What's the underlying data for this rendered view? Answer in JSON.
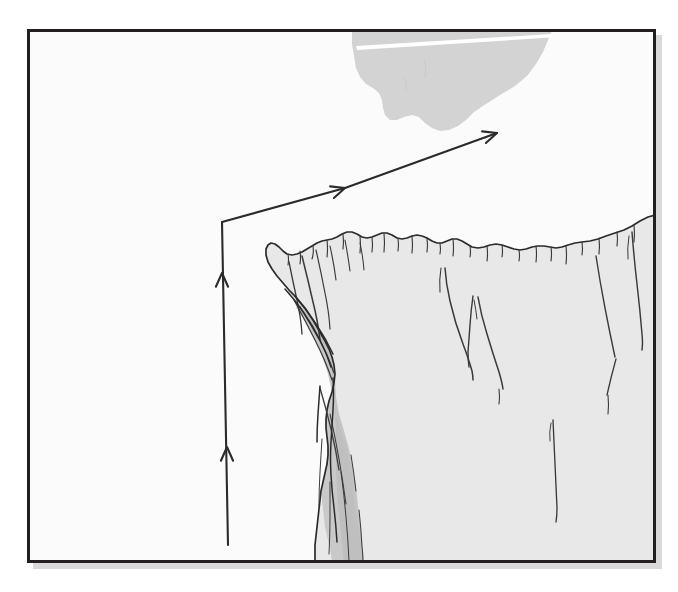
{
  "figure": {
    "title": "Cliff edge cross-section with ascent and traverse path",
    "kind": "hand-drawn line illustration",
    "background_color": "#ffffff",
    "frame": {
      "name": "illustration-border",
      "x": 27,
      "y": 29,
      "width": 629,
      "height": 534,
      "stroke_color": "#231f20",
      "stroke_width": 3,
      "fill_color": "#fbfbfb",
      "shadow_color": "#d9d9d9"
    },
    "palette": {
      "ink": "#2b2b2b",
      "ink_light": "#4a4a4a",
      "cliff_face": "#e8e8e8",
      "cliff_face_edge": "#e2e2e2",
      "gully_shadow": "#c9c9c9",
      "gully_shadow_deep": "#bdbdbd",
      "cloud_gray": "#d3d3d3",
      "paper": "#fbfbfb",
      "white": "#ffffff"
    },
    "elements": [
      {
        "name": "cloud-mass",
        "label": "gray cloud / overhang mass hanging from top border",
        "fill": "#d3d3d3",
        "highlight_streak": "#ffffff"
      },
      {
        "name": "cliff-plateau",
        "label": "light gray cliff mass with jagged rim and vertical cracks",
        "fill": "#e8e8e8"
      },
      {
        "name": "cliff-gully-shadow",
        "label": "darker shaded gully on the left flank of the cliff",
        "fill": "#c9c9c9"
      },
      {
        "name": "path-arrow",
        "label": "path arrow: vertical ascent then diagonal traverse up-right",
        "stroke": "#2b2b2b",
        "arrowheads": 4
      }
    ]
  },
  "path_arrow": {
    "name": "ascent-traverse-arrow",
    "vertical_segment": {
      "label": "vertical ascent segment",
      "start": [
        228,
        545
      ],
      "end": [
        222,
        222
      ],
      "direction": "up"
    },
    "diagonal_segment": {
      "label": "diagonal traverse segment",
      "start": [
        222,
        222
      ],
      "end": [
        497,
        133
      ],
      "direction": "up-right"
    },
    "chevrons": [
      {
        "name": "chevron-vertical-lower",
        "at": [
          227,
          447
        ],
        "heading": "up"
      },
      {
        "name": "chevron-vertical-upper",
        "at": [
          222,
          273
        ],
        "heading": "up"
      },
      {
        "name": "chevron-diagonal-mid",
        "at": [
          345,
          188
        ],
        "heading": "up-right"
      },
      {
        "name": "chevron-diagonal-tip",
        "at": [
          497,
          133
        ],
        "heading": "up-right"
      }
    ]
  },
  "labels": {
    "figure_caption": "",
    "annotations": []
  }
}
